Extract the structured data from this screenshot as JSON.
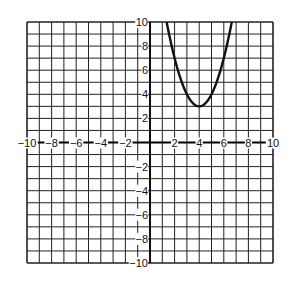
{
  "chart_data": {
    "type": "line",
    "title": "",
    "xlabel": "",
    "ylabel": "",
    "xlim": [
      -10,
      10
    ],
    "ylim": [
      -10,
      10
    ],
    "grid": true,
    "grid_step": 1,
    "x_tick_labels": [
      "-10",
      "-8",
      "-6",
      "-4",
      "-2",
      "2",
      "4",
      "6",
      "8",
      "10"
    ],
    "y_tick_labels": [
      "10",
      "8",
      "6",
      "4",
      "2",
      "-2",
      "-4",
      "-6",
      "-8",
      "-10"
    ],
    "series": [
      {
        "name": "parabola",
        "equation": "y = (x-4)^2 + 3",
        "vertex": [
          4,
          3
        ],
        "x": [
          1.35,
          2,
          3,
          4,
          5,
          6,
          6.65
        ],
        "y": [
          10,
          7,
          4,
          3,
          4,
          7,
          10
        ],
        "color": "#111111"
      }
    ]
  }
}
